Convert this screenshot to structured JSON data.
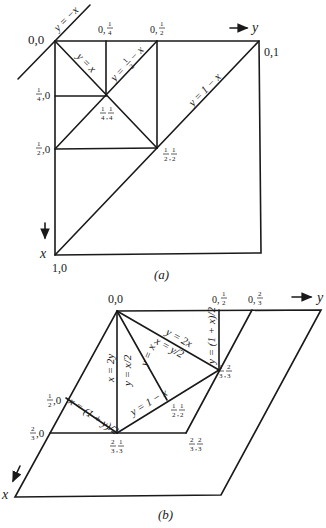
{
  "figure_a": {
    "caption": "(a)",
    "axis_x_label": "x",
    "axis_y_label": "y",
    "vertex_labels": {
      "origin": "0,0",
      "q_quarter_top": [
        "0,",
        "1",
        "4"
      ],
      "q_half_top": [
        "0,",
        "1",
        "2"
      ],
      "corner_top_right": "0,1",
      "q_quarter_left": [
        "1",
        "4",
        ",0"
      ],
      "q_half_left": [
        "1",
        "2",
        ",0"
      ],
      "center_quarter": [
        "1",
        "4",
        "1",
        "4"
      ],
      "center_half": [
        "1",
        "2",
        "1",
        "2"
      ],
      "corner_bottom_left": "1,0"
    },
    "line_labels": {
      "y_eq_neg_x": "y = −x",
      "y_eq_x": "y = x",
      "y_eq_half_minus_x": [
        "y =",
        "1",
        "2",
        "− x"
      ],
      "y_eq_one_minus_x": "y = 1 − x"
    }
  },
  "figure_b": {
    "caption": "(b)",
    "axis_x_label": "x",
    "axis_y_label": "y",
    "vertex_labels": {
      "origin": "0,0",
      "top_half": [
        "0,",
        "1",
        "2"
      ],
      "top_two_thirds": [
        "0,",
        "2",
        "3"
      ],
      "third_two_thirds": [
        "1",
        "3",
        "2",
        "3"
      ],
      "half_zero": [
        "1",
        "2",
        ",0"
      ],
      "two_thirds_zero": [
        "2",
        "3",
        ",0"
      ],
      "two_thirds_third": [
        "2",
        "3",
        "1",
        "3"
      ],
      "half_half": [
        "1",
        "2",
        "1",
        "2"
      ],
      "two_thirds_two_thirds": [
        "2",
        "3",
        "2",
        "3"
      ]
    },
    "line_labels": {
      "x_eq_2y": "x = 2y",
      "y_eq_x_half": "y = x/2",
      "y_eq_x": "y = x",
      "y_eq_2x": "y = 2x",
      "x_eq_y_half": "x = y/2",
      "y_eq_one_plus_x_half": "y = (1 + x)/2",
      "x_eq_one_plus_y_half": "x = (1 + y)/2",
      "y_eq_one_minus_x": "y = 1 − x"
    }
  }
}
